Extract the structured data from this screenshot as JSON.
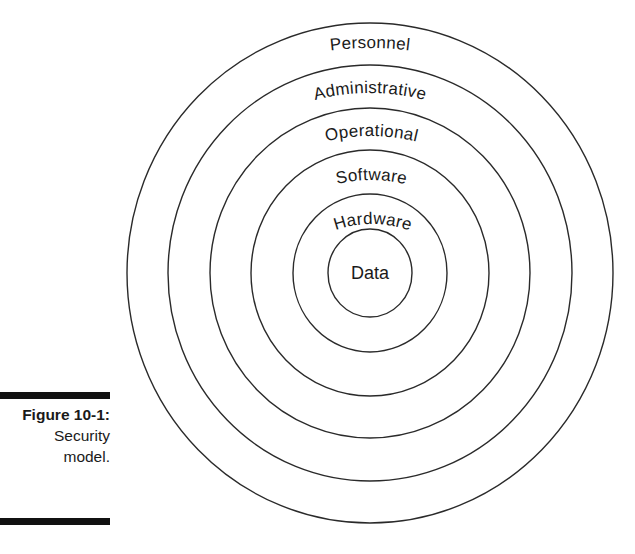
{
  "diagram": {
    "title": "Security model",
    "layers": [
      {
        "label": "Personnel",
        "rx": 243,
        "ry": 250
      },
      {
        "label": "Administrative",
        "rx": 202,
        "ry": 208
      },
      {
        "label": "Operational",
        "rx": 160,
        "ry": 165
      },
      {
        "label": "Software",
        "rx": 119,
        "ry": 123
      },
      {
        "label": "Hardware",
        "rx": 77,
        "ry": 79
      },
      {
        "label": "Data",
        "rx": 42,
        "ry": 44
      }
    ],
    "center": {
      "x": 370,
      "y": 273
    },
    "stroke_color": "#2a2a2a"
  },
  "caption": {
    "figure_number": "Figure 10-1:",
    "line1": "Security",
    "line2": "model."
  }
}
